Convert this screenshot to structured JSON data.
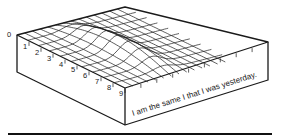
{
  "diagram": {
    "title": "",
    "box_caption": "I am the same I that I was yesterday.",
    "axis_labels": [
      "0",
      "1",
      "2",
      "3",
      "4",
      "5",
      "6",
      "7",
      "8",
      "9"
    ],
    "surface": {
      "rows": 10,
      "cols": 14,
      "peak_col": 6,
      "shape": "gaussian ridge across rows"
    },
    "colors": {
      "line": "#1a1a1a",
      "background": "#ffffff"
    }
  }
}
